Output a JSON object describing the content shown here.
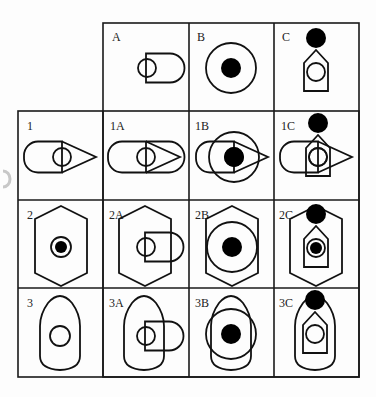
{
  "diagram": {
    "title": "",
    "grid": {
      "columns": [
        "",
        "A",
        "B",
        "C"
      ],
      "rows": [
        "",
        "1",
        "2",
        "3"
      ]
    },
    "components": {
      "A": "circle overlapping rounded rectangle",
      "B": "large ring with filled dot",
      "C": "house pentagon with inner circle and filled ball on top",
      "1": "rounded rectangle with circle and triangle point",
      "2": "hexagon with double ring and filled dot",
      "3": "bullet shape with circle"
    },
    "cells": [
      {
        "id": "A",
        "label": "A",
        "row": 0,
        "col": 1
      },
      {
        "id": "B",
        "label": "B",
        "row": 0,
        "col": 2
      },
      {
        "id": "C",
        "label": "C",
        "row": 0,
        "col": 3
      },
      {
        "id": "1",
        "label": "1",
        "row": 1,
        "col": 0
      },
      {
        "id": "1A",
        "label": "1A",
        "row": 1,
        "col": 1
      },
      {
        "id": "1B",
        "label": "1B",
        "row": 1,
        "col": 2
      },
      {
        "id": "1C",
        "label": "1C",
        "row": 1,
        "col": 3
      },
      {
        "id": "2",
        "label": "2",
        "row": 2,
        "col": 0
      },
      {
        "id": "2A",
        "label": "2A",
        "row": 2,
        "col": 1
      },
      {
        "id": "2B",
        "label": "2B",
        "row": 2,
        "col": 2
      },
      {
        "id": "2C",
        "label": "2C",
        "row": 2,
        "col": 3
      },
      {
        "id": "3",
        "label": "3",
        "row": 3,
        "col": 0
      },
      {
        "id": "3A",
        "label": "3A",
        "row": 3,
        "col": 1
      },
      {
        "id": "3B",
        "label": "3B",
        "row": 3,
        "col": 2
      },
      {
        "id": "3C",
        "label": "3C",
        "row": 3,
        "col": 3
      }
    ]
  },
  "labels": {
    "A": "A",
    "B": "B",
    "C": "C",
    "r1": "1",
    "r1A": "1A",
    "r1B": "1B",
    "r1C": "1C",
    "r2": "2",
    "r2A": "2A",
    "r2B": "2B",
    "r2C": "2C",
    "r3": "3",
    "r3A": "3A",
    "r3B": "3B",
    "r3C": "3C"
  },
  "colors": {
    "stroke": "#111111",
    "fill": "#000000",
    "background": "#fdfdfd",
    "grid": "#1a1a1a"
  }
}
